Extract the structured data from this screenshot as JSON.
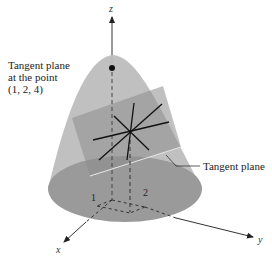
{
  "figure": {
    "annotations": {
      "point_label_line1": "Tangent plane",
      "point_label_line2": "at the point",
      "point_label_line3": "(1, 2, 4)",
      "plane_label": "Tangent plane"
    },
    "axes": {
      "x": "x",
      "y": "y",
      "z": "z"
    },
    "ticks": {
      "x_tick": "1",
      "y_tick": "2"
    },
    "point": {
      "x": 1,
      "y": 2,
      "z": 4
    },
    "colors": {
      "surface": "#a9a9a9",
      "surface_base": "#8f8f8f",
      "plane": "#b5b5b5",
      "lines": "#111111",
      "background": "#ffffff"
    }
  }
}
